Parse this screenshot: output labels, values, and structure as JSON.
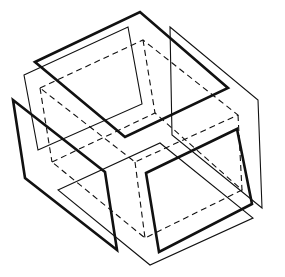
{
  "figure": {
    "title": "",
    "stroke_color": "#111111",
    "background": "#ffffff"
  },
  "cube_dashed": {
    "top_face": [
      [
        40,
        88
      ],
      [
        143,
        40
      ],
      [
        238,
        115
      ],
      [
        135,
        162
      ]
    ],
    "bottom_face": [
      [
        52,
        162
      ],
      [
        155,
        113
      ],
      [
        242,
        190
      ],
      [
        145,
        238
      ]
    ]
  },
  "planes": [
    {
      "name": "top-thick",
      "style": "thick",
      "points": [
        [
          35,
          62
        ],
        [
          140,
          12
        ],
        [
          228,
          88
        ],
        [
          125,
          137
        ]
      ]
    },
    {
      "name": "top-thin",
      "style": "thin",
      "points": [
        [
          24,
          75
        ],
        [
          128,
          27
        ],
        [
          142,
          104
        ],
        [
          38,
          150
        ]
      ]
    },
    {
      "name": "right-thin",
      "style": "thin",
      "points": [
        [
          170,
          27
        ],
        [
          258,
          100
        ],
        [
          262,
          208
        ],
        [
          172,
          135
        ]
      ]
    },
    {
      "name": "left-thick",
      "style": "thick",
      "points": [
        [
          13,
          100
        ],
        [
          25,
          178
        ],
        [
          117,
          250
        ],
        [
          105,
          172
        ]
      ]
    },
    {
      "name": "bottom-thin",
      "style": "thin",
      "points": [
        [
          58,
          190
        ],
        [
          160,
          143
        ],
        [
          253,
          218
        ],
        [
          150,
          265
        ]
      ]
    },
    {
      "name": "front-thick",
      "style": "thick",
      "points": [
        [
          146,
          173
        ],
        [
          237,
          129
        ],
        [
          252,
          204
        ],
        [
          159,
          252
        ]
      ]
    }
  ]
}
